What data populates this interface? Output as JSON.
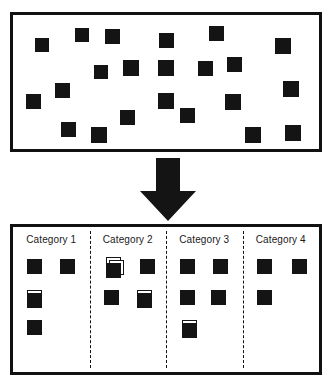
{
  "diagram": {
    "type": "process-flow",
    "colors": {
      "item_fill": "#141414",
      "frame": "#111111",
      "background": "#ffffff",
      "arrow": "#141414",
      "divider": "#111111"
    },
    "unsorted": {
      "name": "unsorted-items-box",
      "item_count": 24,
      "items": [
        {
          "x": 22,
          "y": 23,
          "size": 14
        },
        {
          "x": 62,
          "y": 13,
          "size": 14
        },
        {
          "x": 92,
          "y": 14,
          "size": 15
        },
        {
          "x": 146,
          "y": 18,
          "size": 15
        },
        {
          "x": 196,
          "y": 11,
          "size": 15
        },
        {
          "x": 262,
          "y": 23,
          "size": 16
        },
        {
          "x": 214,
          "y": 42,
          "size": 15
        },
        {
          "x": 81,
          "y": 50,
          "size": 14
        },
        {
          "x": 110,
          "y": 45,
          "size": 16
        },
        {
          "x": 145,
          "y": 45,
          "size": 16
        },
        {
          "x": 185,
          "y": 46,
          "size": 15
        },
        {
          "x": 270,
          "y": 66,
          "size": 16
        },
        {
          "x": 42,
          "y": 68,
          "size": 15
        },
        {
          "x": 13,
          "y": 79,
          "size": 15
        },
        {
          "x": 145,
          "y": 78,
          "size": 16
        },
        {
          "x": 212,
          "y": 79,
          "size": 16
        },
        {
          "x": 107,
          "y": 95,
          "size": 15
        },
        {
          "x": 167,
          "y": 93,
          "size": 15
        },
        {
          "x": 48,
          "y": 107,
          "size": 15
        },
        {
          "x": 78,
          "y": 112,
          "size": 16
        },
        {
          "x": 232,
          "y": 112,
          "size": 16
        },
        {
          "x": 272,
          "y": 110,
          "size": 16
        }
      ]
    },
    "arrow": {
      "name": "down-arrow",
      "direction": "down",
      "label": ""
    },
    "sorted": {
      "name": "categorized-items-box",
      "categories": [
        {
          "label": "Category 1",
          "items": [
            {
              "x": 14,
              "y": 32,
              "size": 15,
              "stacked": 1
            },
            {
              "x": 47,
              "y": 32,
              "size": 15,
              "stacked": 1
            },
            {
              "x": 14,
              "y": 63,
              "size": 15,
              "stacked": 2
            },
            {
              "x": 14,
              "y": 93,
              "size": 15,
              "stacked": 1
            }
          ]
        },
        {
          "label": "Category 2",
          "items": [
            {
              "x": 16,
              "y": 30,
              "size": 15,
              "stacked": 3
            },
            {
              "x": 50,
              "y": 32,
              "size": 15,
              "stacked": 1
            },
            {
              "x": 14,
              "y": 63,
              "size": 15,
              "stacked": 1
            },
            {
              "x": 47,
              "y": 63,
              "size": 15,
              "stacked": 2
            }
          ]
        },
        {
          "label": "Category 3",
          "items": [
            {
              "x": 14,
              "y": 32,
              "size": 15,
              "stacked": 1
            },
            {
              "x": 47,
              "y": 32,
              "size": 15,
              "stacked": 1
            },
            {
              "x": 14,
              "y": 63,
              "size": 15,
              "stacked": 1
            },
            {
              "x": 45,
              "y": 63,
              "size": 15,
              "stacked": 1
            },
            {
              "x": 16,
              "y": 93,
              "size": 15,
              "stacked": 2
            }
          ]
        },
        {
          "label": "Category 4",
          "items": [
            {
              "x": 14,
              "y": 32,
              "size": 15,
              "stacked": 1
            },
            {
              "x": 49,
              "y": 32,
              "size": 15,
              "stacked": 1
            },
            {
              "x": 14,
              "y": 63,
              "size": 15,
              "stacked": 1
            }
          ]
        }
      ]
    }
  }
}
